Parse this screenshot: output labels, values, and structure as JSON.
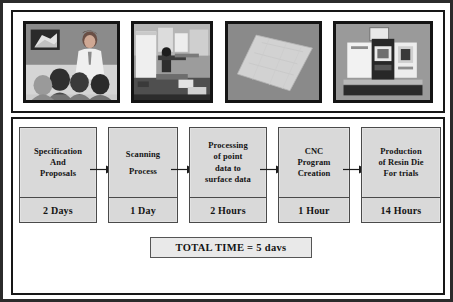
{
  "figure": {
    "photo_strip": {
      "photos": [
        {
          "name": "photo-specification-meeting",
          "caption": "Specification meeting: presenter addressing a seated audience with a projected drawing"
        },
        {
          "name": "photo-scanning-equipment",
          "caption": "Scanning equipment set up in a laboratory workspace"
        },
        {
          "name": "photo-surface-model",
          "caption": "Rendered surface data model: tilted light grey panel on dark background"
        },
        {
          "name": "photo-cnc-machine",
          "caption": "CNC machining centre with control panel"
        }
      ]
    },
    "flow": {
      "steps": [
        {
          "label": "Specification\nAnd\nProposals",
          "duration": "2 Days"
        },
        {
          "label": "Scanning\nProcess",
          "duration": "1 Day"
        },
        {
          "label": "Processing\nof point\ndata to\nsurface data",
          "duration": "2 Hours"
        },
        {
          "label": "CNC\nProgram\nCreation",
          "duration": "1 Hour"
        },
        {
          "label": "Production\nof Resin Die\nFor trials",
          "duration": "14 Hours"
        }
      ],
      "arrow_count": 4,
      "arrow_name": "flow-arrow"
    },
    "total": {
      "text": "TOTAL TIME = 5 davs"
    },
    "colors": {
      "frame": "#2b2b2b",
      "panel_border": "#171717",
      "box_fill": "#d9d9d9",
      "box_border": "#4a4a4a",
      "total_fill": "#e9e9e9",
      "text": "#141414"
    }
  }
}
